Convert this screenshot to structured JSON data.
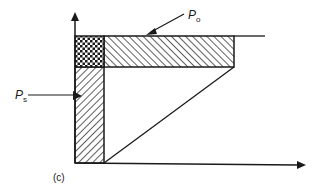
{
  "figure": {
    "caption": "(c)",
    "labels": {
      "p_o": {
        "main": "P",
        "sub": "o"
      },
      "p_s": {
        "main": "P",
        "sub": "s"
      }
    },
    "regions": [
      {
        "name": "horizontal-hatched-band",
        "pattern": "diagonal-hatch"
      },
      {
        "name": "vertical-hatched-band",
        "pattern": "diagonal-hatch"
      },
      {
        "name": "overlap-crosshatched-box",
        "pattern": "cross-hatch"
      }
    ],
    "axes": {
      "x": "arrow-right",
      "y": "arrow-up"
    },
    "colors": {
      "ink": "#1a1a1a",
      "background": "#ffffff"
    }
  }
}
